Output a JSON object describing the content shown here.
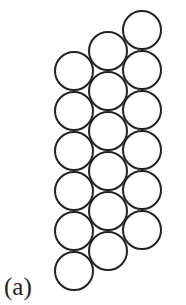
{
  "figure": {
    "label": "(a)",
    "stroke_color": "#222222",
    "radius": 20,
    "circles": [
      {
        "cx": 142,
        "cy": 30
      },
      {
        "cx": 142,
        "cy": 70
      },
      {
        "cx": 142,
        "cy": 110
      },
      {
        "cx": 142,
        "cy": 150
      },
      {
        "cx": 142,
        "cy": 190
      },
      {
        "cx": 142,
        "cy": 230
      },
      {
        "cx": 108,
        "cy": 51
      },
      {
        "cx": 108,
        "cy": 91
      },
      {
        "cx": 108,
        "cy": 131
      },
      {
        "cx": 108,
        "cy": 171
      },
      {
        "cx": 108,
        "cy": 211
      },
      {
        "cx": 108,
        "cy": 251
      },
      {
        "cx": 74,
        "cy": 71
      },
      {
        "cx": 74,
        "cy": 111
      },
      {
        "cx": 74,
        "cy": 151
      },
      {
        "cx": 74,
        "cy": 191
      },
      {
        "cx": 74,
        "cy": 231
      },
      {
        "cx": 74,
        "cy": 271
      }
    ]
  }
}
